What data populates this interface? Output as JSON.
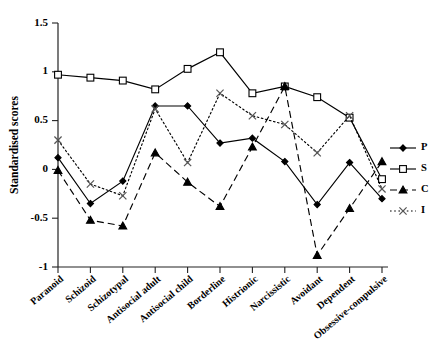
{
  "chart_data": {
    "type": "line",
    "title": "",
    "xlabel": "",
    "ylabel": "Standardised scores",
    "ylim": [
      -1,
      1.5
    ],
    "ytick_labels": [
      "1.5",
      "1",
      "0.5",
      "0",
      "-0.5",
      "-1"
    ],
    "ytick_values": [
      1.5,
      1,
      0.5,
      0,
      -0.5,
      -1
    ],
    "grid": false,
    "legend_position": "right",
    "categories": [
      "Paranoid",
      "Schizoid",
      "Schizotypal",
      "Antisocial adult",
      "Antisocial child",
      "Borderline",
      "Histrionic",
      "Narcissistic",
      "Avoidant",
      "Dependent",
      "Obsessive-compulsive"
    ],
    "series": [
      {
        "name": "P",
        "marker": "diamond",
        "line_style": "solid",
        "values": [
          0.12,
          -0.35,
          -0.12,
          0.65,
          0.65,
          0.27,
          0.32,
          0.08,
          -0.36,
          0.07,
          -0.3
        ]
      },
      {
        "name": "S",
        "marker": "square-open",
        "line_style": "solid",
        "values": [
          0.97,
          0.94,
          0.91,
          0.82,
          1.03,
          1.2,
          0.78,
          0.85,
          0.74,
          0.53,
          -0.1
        ]
      },
      {
        "name": "C",
        "marker": "triangle",
        "line_style": "dashed",
        "values": [
          -0.01,
          -0.52,
          -0.58,
          0.17,
          -0.13,
          -0.38,
          0.23,
          0.85,
          -0.88,
          -0.4,
          0.08
        ]
      },
      {
        "name": "I",
        "marker": "x",
        "line_style": "dotted",
        "values": [
          0.3,
          -0.15,
          -0.27,
          0.62,
          0.07,
          0.78,
          0.55,
          0.46,
          0.17,
          0.55,
          -0.2
        ]
      }
    ]
  },
  "legend": {
    "entries": [
      {
        "label": "P"
      },
      {
        "label": "S"
      },
      {
        "label": "C"
      },
      {
        "label": "I"
      }
    ]
  },
  "axes": {
    "y_axis_title": "Standardised scores"
  }
}
